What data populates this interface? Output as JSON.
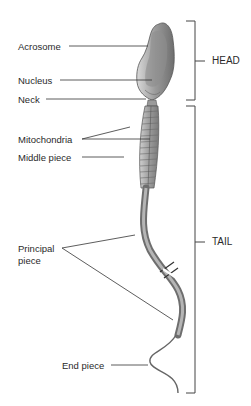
{
  "diagram": {
    "labels": {
      "acrosome": "Acrosome",
      "nucleus": "Nucleus",
      "neck": "Neck",
      "mitochondria": "Mitochondria",
      "middle_piece": "Middle piece",
      "principal_piece_line1": "Principal",
      "principal_piece_line2": "piece",
      "end_piece": "End piece"
    },
    "sections": {
      "head": "HEAD",
      "tail": "TAIL"
    },
    "colors": {
      "line": "#333333",
      "cell_dark": "#7a7a7a",
      "cell_light": "#c8c8c8"
    }
  }
}
